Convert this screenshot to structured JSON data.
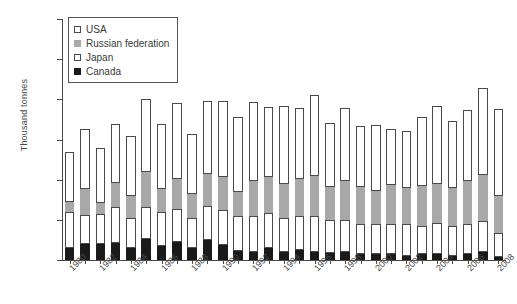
{
  "chart_data": {
    "type": "bar",
    "stacked": true,
    "title": "",
    "xlabel": "",
    "ylabel": "Thousand tonnes",
    "ylim": [
      0,
      1200
    ],
    "ytick_step": 200,
    "yticks": [
      0,
      200,
      400,
      600,
      800,
      1000,
      1200
    ],
    "grid": false,
    "legend_position": "top-left",
    "categories": [
      "1980",
      "1981",
      "1982",
      "1983",
      "1984",
      "1985",
      "1986",
      "1987",
      "1988",
      "1989",
      "1990",
      "1991",
      "1992",
      "1993",
      "1994",
      "1995",
      "1996",
      "1997",
      "1998",
      "1999",
      "2000",
      "2001",
      "2002",
      "2003",
      "2004",
      "2005",
      "2006",
      "2007",
      "2008"
    ],
    "tick_labels": [
      "1980",
      "",
      "1982",
      "",
      "1984",
      "",
      "1986",
      "",
      "1988",
      "",
      "1990",
      "",
      "1992",
      "",
      "1994",
      "",
      "1996",
      "",
      "1998",
      "",
      "2000",
      "",
      "2002",
      "",
      "2004",
      "",
      "2006",
      "",
      "2008"
    ],
    "series": [
      {
        "name": "Canada",
        "color": "#1a1a1a",
        "pattern": "solid-black",
        "values": [
          62,
          80,
          78,
          85,
          62,
          105,
          70,
          90,
          62,
          100,
          75,
          45,
          40,
          60,
          38,
          50,
          42,
          35,
          38,
          30,
          32,
          30,
          18,
          28,
          32,
          22,
          30,
          40,
          14
        ]
      },
      {
        "name": "Japan",
        "color": "#ffffff",
        "pattern": "white",
        "values": [
          178,
          145,
          150,
          178,
          148,
          158,
          168,
          165,
          148,
          170,
          172,
          172,
          180,
          175,
          172,
          168,
          178,
          165,
          160,
          150,
          148,
          150,
          160,
          142,
          150,
          148,
          150,
          155,
          120
        ]
      },
      {
        "name": "Russian federation",
        "color": "#a8a8a8",
        "pattern": "gray",
        "values": [
          50,
          130,
          55,
          120,
          108,
          175,
          118,
          150,
          118,
          160,
          165,
          120,
          175,
          180,
          170,
          185,
          200,
          165,
          195,
          185,
          165,
          195,
          180,
          200,
          198,
          190,
          215,
          230,
          185
        ]
      },
      {
        "name": "USA",
        "color": "#ffffff",
        "pattern": "dotted",
        "values": [
          248,
          295,
          277,
          292,
          300,
          362,
          322,
          375,
          300,
          360,
          378,
          375,
          390,
          345,
          385,
          355,
          402,
          318,
          362,
          300,
          325,
          278,
          282,
          340,
          385,
          330,
          352,
          430,
          432
        ]
      }
    ]
  },
  "legend": {
    "items": [
      {
        "label": "USA",
        "swatch": "usa-swatch"
      },
      {
        "label": "Russian federation",
        "swatch": "russia-swatch"
      },
      {
        "label": "Japan",
        "swatch": "japan-swatch"
      },
      {
        "label": "Canada",
        "swatch": "canada-swatch"
      }
    ]
  },
  "axes": {
    "y_title": "Thousand tonnes"
  }
}
